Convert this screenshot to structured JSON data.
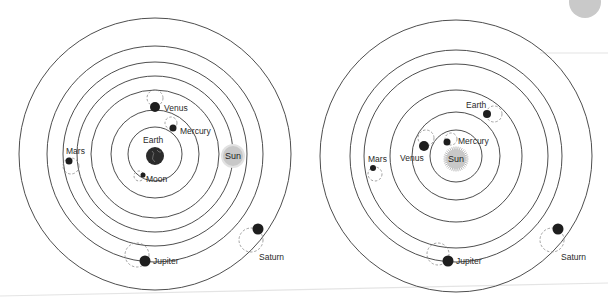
{
  "colors": {
    "ring": "#3a3a3a",
    "planet": "#1e1e1e",
    "venus": "#3d3d3d",
    "sun_fill": "#c8c8c8",
    "epicycle": "#8a8a8a",
    "corner_disc": "#c9c9c9",
    "rule_line": "#e4e4e4"
  },
  "diagrams": [
    {
      "id": "geocentric",
      "title": "Geocentric model",
      "center": [
        155,
        154
      ],
      "ring_radii": [
        136,
        108,
        92,
        78,
        64,
        44,
        27
      ],
      "bodies": [
        {
          "name": "Earth",
          "label": "Earth",
          "x": 155,
          "y": 156,
          "r": 9,
          "lx": 143,
          "ly": 143,
          "kind": "earth"
        },
        {
          "name": "Moon",
          "label": "Moon",
          "x": 143,
          "y": 175,
          "r": 2.5,
          "lx": 146,
          "ly": 182,
          "epi": [
            139,
            176,
            5
          ]
        },
        {
          "name": "Mercury",
          "label": "Mercury",
          "x": 173,
          "y": 128,
          "r": 3.5,
          "lx": 180,
          "ly": 134,
          "epi": [
            171,
            123,
            6
          ]
        },
        {
          "name": "Venus",
          "label": "Venus",
          "x": 155,
          "y": 107,
          "r": 5,
          "lx": 164,
          "ly": 111,
          "epi": [
            155,
            98,
            8
          ]
        },
        {
          "name": "Sun",
          "label": "Sun",
          "x": 233,
          "y": 156,
          "r": 10,
          "kind": "sun-soft"
        },
        {
          "name": "Mars",
          "label": "Mars",
          "x": 69,
          "y": 161,
          "r": 3.5,
          "lx": 66,
          "ly": 154,
          "epi": [
            71,
            166,
            8
          ]
        },
        {
          "name": "Jupiter",
          "label": "Jupiter",
          "x": 145,
          "y": 261,
          "r": 5.5,
          "lx": 153,
          "ly": 264,
          "epi": [
            137,
            255,
            12
          ]
        },
        {
          "name": "Saturn",
          "label": "Saturn",
          "x": 258,
          "y": 229,
          "r": 5.5,
          "lx": 259,
          "ly": 260,
          "epi": [
            251,
            240,
            12
          ]
        }
      ]
    },
    {
      "id": "heliocentric",
      "title": "Heliocentric model",
      "center": [
        456,
        156
      ],
      "ring_radii": [
        136,
        106,
        92,
        66,
        44,
        26
      ],
      "bodies": [
        {
          "name": "Sun",
          "label": "Sun",
          "x": 456,
          "y": 159,
          "r": 10,
          "kind": "sun-burst"
        },
        {
          "name": "Mercury",
          "label": "Mercury",
          "x": 447,
          "y": 142,
          "r": 3.5,
          "lx": 458,
          "ly": 144,
          "epi": [
            451,
            139,
            6
          ]
        },
        {
          "name": "Venus",
          "label": "Venus",
          "x": 424,
          "y": 146,
          "r": 5,
          "lx": 400,
          "ly": 161,
          "epi": [
            426,
            138,
            8
          ]
        },
        {
          "name": "Earth",
          "label": "Earth",
          "x": 487,
          "y": 114,
          "r": 4,
          "lx": 466,
          "ly": 108,
          "epi": [
            494,
            114,
            8
          ]
        },
        {
          "name": "Mars",
          "label": "Mars",
          "x": 373,
          "y": 168,
          "r": 3,
          "lx": 368,
          "ly": 162,
          "epi": [
            375,
            174,
            7
          ]
        },
        {
          "name": "Jupiter",
          "label": "Jupiter",
          "x": 448,
          "y": 261,
          "r": 5.5,
          "lx": 456,
          "ly": 264,
          "epi": [
            438,
            254,
            11
          ]
        },
        {
          "name": "Saturn",
          "label": "Saturn",
          "x": 558,
          "y": 229,
          "r": 5.5,
          "lx": 561,
          "ly": 260,
          "epi": [
            552,
            240,
            12
          ]
        }
      ]
    }
  ],
  "decorations": {
    "corner_disc": {
      "cx": 585,
      "cy": 2,
      "r": 16
    },
    "rule_lines": [
      {
        "x1": 540,
        "y1": 53,
        "x2": 608,
        "y2": 53
      },
      {
        "x1": 0,
        "y1": 296,
        "x2": 608,
        "y2": 283
      }
    ]
  }
}
